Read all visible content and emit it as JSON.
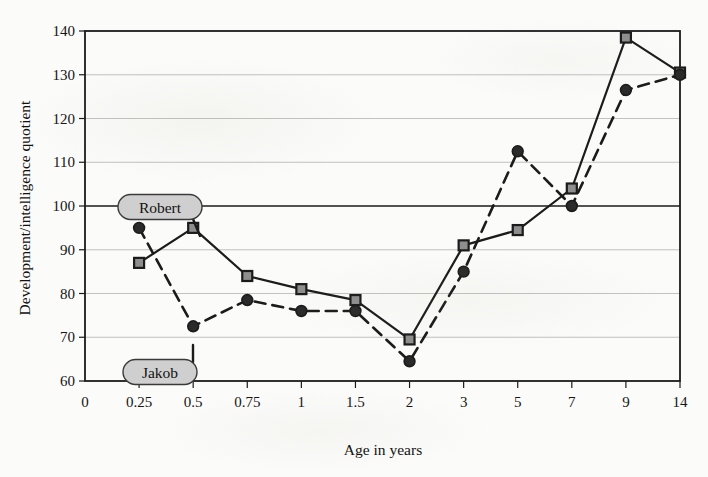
{
  "chart_data": {
    "type": "line",
    "title": "",
    "xlabel": "Age in years",
    "ylabel": "Development/intelligence quotient",
    "categories": [
      "0.25",
      "0.5",
      "0.75",
      "1",
      "1.5",
      "2",
      "3",
      "5",
      "7",
      "9",
      "14"
    ],
    "x_tick_labels": [
      "0",
      "0.25",
      "0.5",
      "0.75",
      "1",
      "1.5",
      "2",
      "3",
      "5",
      "7",
      "9",
      "14"
    ],
    "y_tick_labels": [
      "60",
      "70",
      "80",
      "90",
      "100",
      "110",
      "120",
      "130",
      "140"
    ],
    "ylim": [
      60,
      140
    ],
    "y_tick_step": 10,
    "grid": true,
    "emphasized_gridlines": [
      100
    ],
    "legend_position": "inline-callout",
    "series": [
      {
        "name": "Robert",
        "marker": "square",
        "line_style": "solid",
        "color": "#1b1b1b",
        "marker_fill": "#8e8e8e",
        "values": [
          87,
          95,
          84,
          81,
          78.5,
          69.5,
          91,
          94.5,
          104,
          138.5,
          130.5
        ]
      },
      {
        "name": "Jakob",
        "marker": "circle",
        "line_style": "dashed",
        "color": "#1b1b1b",
        "marker_fill": "#2a2a2a",
        "values": [
          95,
          72.5,
          78.5,
          76,
          76,
          64.5,
          85,
          112.5,
          100,
          126.5,
          130
        ]
      }
    ],
    "annotations": [
      {
        "label": "Robert",
        "points_to_series": "Robert",
        "points_to_index": 1
      },
      {
        "label": "Jakob",
        "points_to_series": "Jakob",
        "points_to_index": 1
      }
    ]
  }
}
